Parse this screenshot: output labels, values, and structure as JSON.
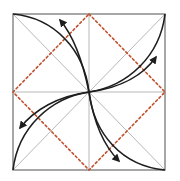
{
  "diagram": {
    "title": "",
    "square": {
      "x": 13,
      "y": 14,
      "width": 152,
      "height": 156
    },
    "center": {
      "x": 89,
      "y": 92
    },
    "colors": {
      "background": "#ffffff",
      "outline": "#8a8a8a",
      "crease": "#b8b8b8",
      "dotted_fold": "#c0502e",
      "arrow": "#1e1e1e"
    },
    "creases": [
      {
        "name": "diagonal-tl-br",
        "from": [
          13,
          14
        ],
        "to": [
          165,
          170
        ]
      },
      {
        "name": "diagonal-tr-bl",
        "from": [
          165,
          14
        ],
        "to": [
          13,
          170
        ]
      },
      {
        "name": "vertical-midline",
        "from": [
          89,
          14
        ],
        "to": [
          89,
          170
        ]
      },
      {
        "name": "horizontal-midline",
        "from": [
          13,
          92
        ],
        "to": [
          165,
          92
        ]
      }
    ],
    "dotted_diamond": [
      [
        89,
        14
      ],
      [
        165,
        92
      ],
      [
        89,
        170
      ],
      [
        13,
        92
      ]
    ],
    "arrows": [
      {
        "name": "top-left",
        "corner": [
          13,
          14
        ],
        "head": [
          60,
          20
        ]
      },
      {
        "name": "top-right",
        "corner": [
          165,
          14
        ],
        "head": [
          156,
          57
        ]
      },
      {
        "name": "bottom-left",
        "corner": [
          13,
          170
        ],
        "head": [
          20,
          128
        ]
      },
      {
        "name": "bottom-right",
        "corner": [
          165,
          170
        ],
        "head": [
          119,
          161
        ]
      }
    ]
  }
}
